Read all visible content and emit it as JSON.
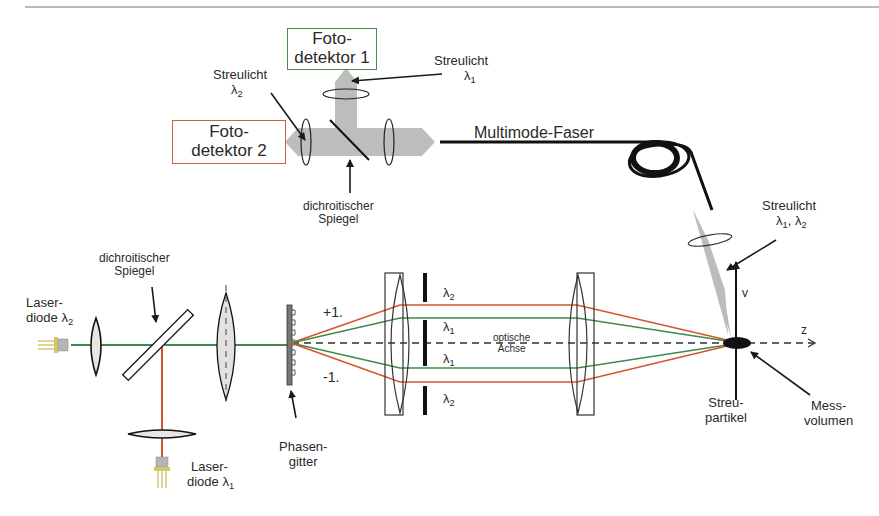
{
  "header": {
    "page_number": "32"
  },
  "colors": {
    "lambda1_beam": "#3f8a4a",
    "lambda2_beam": "#d4552c",
    "detector1_border": "#4e8a4e",
    "detector2_border": "#d0603a",
    "scatter_cone": "#b8b8b8",
    "ink": "#1a1a1a"
  },
  "detectors": {
    "d1": {
      "line1": "Foto-",
      "line2": "detektor 1"
    },
    "d2": {
      "line1": "Foto-",
      "line2": "detektor 2"
    }
  },
  "labels": {
    "streulicht_l2": {
      "line1": "Streulicht",
      "sym": "λ",
      "sub": "2"
    },
    "streulicht_l1": {
      "line1": "Streulicht",
      "sym": "λ",
      "sub": "1"
    },
    "dichro_top": {
      "line1": "dichroitischer",
      "line2": "Spiegel"
    },
    "fiber": "Multimode-Faser",
    "streulicht_both": {
      "line1": "Streulicht",
      "sym1": "λ",
      "sub1": "1",
      "sep": ", ",
      "sym2": "λ",
      "sub2": "2"
    },
    "dichro_left": {
      "line1": "dichroitischer",
      "line2": "Spiegel"
    },
    "laser2": {
      "line1": "Laser-",
      "line2": "diode ",
      "sym": "λ",
      "sub": "2"
    },
    "laser1": {
      "line1": "Laser-",
      "line2": "diode ",
      "sym": "λ",
      "sub": "1"
    },
    "grating": {
      "line1": "Phasen-",
      "line2": "gitter"
    },
    "order_plus": "+1.",
    "order_minus": "-1.",
    "beam_l2_top": {
      "sym": "λ",
      "sub": "2"
    },
    "beam_l1_top": {
      "sym": "λ",
      "sub": "1"
    },
    "beam_l1_bot": {
      "sym": "λ",
      "sub": "1"
    },
    "beam_l2_bot": {
      "sym": "λ",
      "sub": "2"
    },
    "axis": {
      "line1": "optische",
      "line2": "Achse"
    },
    "axis_v": "v",
    "axis_z": "z",
    "particle": {
      "line1": "Streu-",
      "line2": "partikel"
    },
    "volume": {
      "line1": "Mess-",
      "line2": "volumen"
    }
  }
}
